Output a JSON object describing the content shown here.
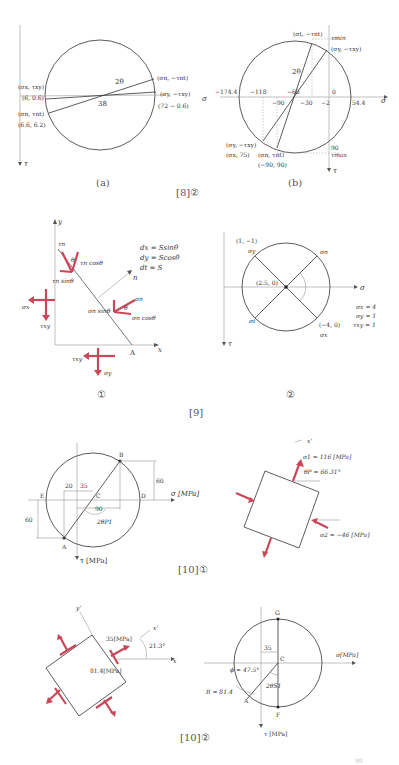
{
  "figure_8_2": {
    "caption": "[8]②",
    "a": {
      "label": "(a)",
      "angle_label": "2θ",
      "center_label": "38",
      "axis_label": "τ",
      "points": [
        {
          "name": "(σx, τxy)",
          "value": "(6, 0.6)"
        },
        {
          "name": "(σn, τnt)",
          "value": "(6.6, 6.2)"
        },
        {
          "name": "(σn, −τnt)",
          "value": ""
        },
        {
          "name": "(σy, −τxy)",
          "value": "(72 − 0.6)"
        }
      ]
    },
    "b": {
      "label": "(b)",
      "angle_label": "2θ",
      "axis_sigma": "σ",
      "axis_tau": "τ",
      "tau_min": "τmin",
      "tau_max": "τmax",
      "ticks": [
        "−174.4",
        "−118",
        "−90",
        "−60",
        "−30",
        "−2",
        "0",
        "54.4",
        "90"
      ],
      "points": [
        {
          "name": "(σt, −τnt)",
          "value": ""
        },
        {
          "name": "(σy, −τxy)",
          "value": ""
        },
        {
          "name": "(σy, −τxy)",
          "value": "(σx, 75)"
        },
        {
          "name": "(σn, τnt)",
          "value": "(−90, 90)"
        }
      ]
    }
  },
  "figure_9": {
    "caption": "[9]",
    "panel1": {
      "label": "①",
      "axis_x": "x",
      "axis_y": "y",
      "point_A": "A",
      "normal": "n",
      "equations": [
        "dx = Ssinθ",
        "dy = Scosθ",
        "dt = S"
      ],
      "labels": [
        "τn",
        "θ",
        "τn cosθ",
        "τn sinθ",
        "σn",
        "θ",
        "σn sinθ",
        "σn cosθ",
        "σx",
        "τxy",
        "τxy",
        "σy"
      ]
    },
    "panel2": {
      "label": "②",
      "axis_sigma": "σ",
      "axis_tau": "τ",
      "center": "(2.5, 0)",
      "p1": "(1, −1)",
      "p1_name": "σy",
      "p2": "(−4, 0)",
      "p2_name": "σx",
      "sn": "σn",
      "st": "σt",
      "given": [
        "σx = 4",
        "σy = 1",
        "τxy = 1"
      ]
    }
  },
  "figure_10_1": {
    "caption": "[10]①",
    "mohr": {
      "axis_sigma": "σ [MPa]",
      "axis_tau": "τ [MPa]",
      "points": [
        "A",
        "B",
        "C",
        "D",
        "E"
      ],
      "dims": [
        "20",
        "35",
        "90",
        "60",
        "60"
      ],
      "angle": "2θP1"
    },
    "element": {
      "axis": "x'",
      "sigma1": "σ1 = 116 [MPa]",
      "theta_p": "θP = 66.31°",
      "sigma2": "σ2 = −46 [MPa]"
    }
  },
  "figure_10_2": {
    "caption": "[10]②",
    "element": {
      "axis_y": "y'",
      "axis_x_prime": "x'",
      "axis_x": "x",
      "shear": "35[MPa]",
      "normal": "81.4[MPa]",
      "angle": "21.3°"
    },
    "mohr": {
      "axis_sigma": "σ[MPa]",
      "axis_tau": "τ [MPa]",
      "points": [
        "G",
        "C",
        "F",
        "A"
      ],
      "dim": "35",
      "phi": "ϕ = 47.5°",
      "radius": "R = 81.4",
      "angle": "2θS1"
    }
  },
  "page_number": "99"
}
